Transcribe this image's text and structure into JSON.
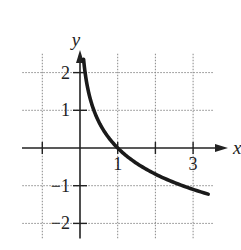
{
  "chart_data": {
    "type": "line",
    "title": "",
    "function": "y = -ln(x)",
    "xlabel": "x",
    "ylabel": "y",
    "xlim": [
      -1,
      3.5
    ],
    "ylim": [
      -2.4,
      2.5
    ],
    "grid": true,
    "x_ticks": [
      -1,
      1,
      2,
      3
    ],
    "x_tick_labels": [
      "",
      "1",
      "",
      "3"
    ],
    "y_ticks": [
      -2,
      -1,
      1,
      2
    ],
    "y_tick_labels": [
      "−2",
      "−1",
      "1",
      "2"
    ],
    "series": [
      {
        "name": "y = -ln x",
        "x": [
          0.1,
          0.2,
          0.3,
          0.5,
          0.75,
          1,
          1.5,
          2,
          2.5,
          3,
          3.4
        ],
        "y": [
          2.3,
          1.61,
          1.2,
          0.69,
          0.29,
          0,
          -0.41,
          -0.69,
          -0.92,
          -1.1,
          -1.22
        ]
      }
    ],
    "legend": null
  }
}
